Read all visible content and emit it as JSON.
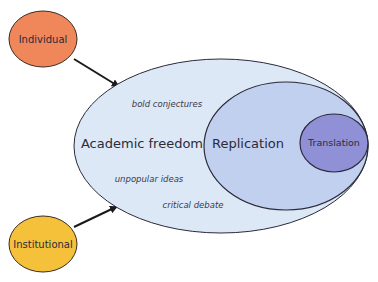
{
  "nodes": {
    "individual": {
      "label": "Individual",
      "color": "#f0875a"
    },
    "institutional": {
      "label": "Institutional",
      "color": "#f5c13a"
    },
    "academic_freedom": {
      "label": "Academic freedom",
      "color": "#dde8f6"
    },
    "replication": {
      "label": "Replication",
      "color": "#c2d0ef"
    },
    "translation": {
      "label": "Translation",
      "color": "#8f90d6"
    }
  },
  "annotations": {
    "bold_conjectures": "bold conjectures",
    "unpopular_ideas": "unpopular ideas",
    "critical_debate": "critical debate"
  },
  "edges": [
    {
      "from": "individual",
      "to": "academic_freedom"
    },
    {
      "from": "institutional",
      "to": "academic_freedom"
    }
  ]
}
